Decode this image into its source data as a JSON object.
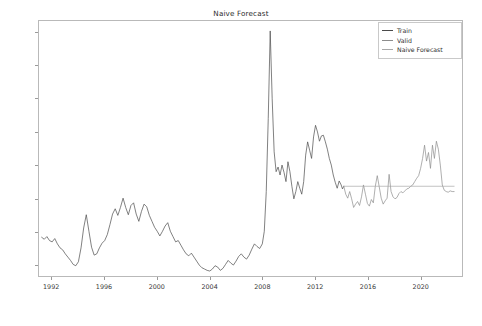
{
  "chart_data": {
    "type": "line",
    "title": "Naive Forecast",
    "xlabel": "",
    "ylabel": "",
    "xlim": [
      1991.0,
      1992.6
    ],
    "ylim": [
      165,
      935
    ],
    "grid": false,
    "legend_position": "upper right",
    "xticks": [
      "1992",
      "1996",
      "2000",
      "2004",
      "2008",
      "2012",
      "2016",
      "2020"
    ],
    "xtick_values": [
      1992,
      1996,
      2000,
      2004,
      2008,
      2012,
      2016,
      2020
    ],
    "yticks": [
      "200",
      "300",
      "400",
      "500",
      "600",
      "700",
      "800",
      "900"
    ],
    "ytick_values": [
      200,
      300,
      400,
      500,
      600,
      700,
      800,
      900
    ],
    "x_axis_range": [
      1991.0,
      2023.2
    ],
    "y_axis_range": [
      165,
      935
    ],
    "series": [
      {
        "name": "Train",
        "color": "#4a4a4a",
        "x": [
          1991.2,
          1991.4,
          1991.6,
          1991.8,
          1992.0,
          1992.2,
          1992.4,
          1992.6,
          1992.8,
          1993.0,
          1993.2,
          1993.4,
          1993.6,
          1993.8,
          1994.0,
          1994.2,
          1994.4,
          1994.6,
          1994.8,
          1995.0,
          1995.2,
          1995.4,
          1995.6,
          1995.8,
          1996.0,
          1996.2,
          1996.4,
          1996.6,
          1996.8,
          1997.0,
          1997.2,
          1997.4,
          1997.6,
          1997.8,
          1998.0,
          1998.2,
          1998.4,
          1998.6,
          1998.8,
          1999.0,
          1999.2,
          1999.4,
          1999.6,
          1999.8,
          2000.0,
          2000.2,
          2000.4,
          2000.6,
          2000.8,
          2001.0,
          2001.2,
          2001.4,
          2001.6,
          2001.8,
          2002.0,
          2002.2,
          2002.4,
          2002.6,
          2002.8,
          2003.0,
          2003.2,
          2003.4,
          2003.6,
          2003.8,
          2004.0,
          2004.2,
          2004.4,
          2004.6,
          2004.8,
          2005.0,
          2005.2,
          2005.4,
          2005.6,
          2005.8,
          2006.0,
          2006.2,
          2006.4,
          2006.6,
          2006.8,
          2007.0,
          2007.2,
          2007.4,
          2007.6,
          2007.8,
          2008.0,
          2008.15,
          2008.3,
          2008.45,
          2008.6,
          2008.75,
          2008.9,
          2009.05,
          2009.2,
          2009.35,
          2009.5,
          2009.65,
          2009.8,
          2009.95,
          2010.1,
          2010.25,
          2010.4,
          2010.55,
          2010.7,
          2010.85,
          2011.0,
          2011.15,
          2011.3,
          2011.45,
          2011.6,
          2011.75,
          2011.9,
          2012.05,
          2012.2,
          2012.35,
          2012.5,
          2012.65,
          2012.8,
          2012.95,
          2013.1,
          2013.25,
          2013.4,
          2013.55,
          2013.7,
          2013.85,
          2014.0,
          2014.1,
          2014.2
        ],
        "y": [
          282,
          276,
          284,
          272,
          268,
          278,
          262,
          250,
          244,
          232,
          222,
          212,
          200,
          196,
          208,
          250,
          310,
          350,
          300,
          252,
          228,
          232,
          250,
          264,
          272,
          290,
          320,
          352,
          368,
          348,
          372,
          400,
          372,
          350,
          378,
          386,
          352,
          330,
          360,
          382,
          374,
          348,
          330,
          312,
          300,
          286,
          300,
          316,
          326,
          300,
          284,
          268,
          272,
          258,
          244,
          232,
          226,
          234,
          222,
          210,
          198,
          190,
          186,
          182,
          180,
          186,
          196,
          192,
          182,
          188,
          200,
          212,
          204,
          198,
          210,
          224,
          232,
          222,
          216,
          228,
          246,
          262,
          254,
          248,
          262,
          300,
          420,
          640,
          905,
          700,
          540,
          480,
          494,
          470,
          500,
          478,
          450,
          510,
          480,
          436,
          398,
          420,
          450,
          430,
          412,
          450,
          530,
          570,
          545,
          520,
          585,
          620,
          600,
          572,
          588,
          590,
          570,
          548,
          520,
          500,
          470,
          448,
          430,
          452,
          440,
          428,
          436
        ]
      },
      {
        "name": "Valid",
        "color": "#8c8c8c",
        "x": [
          2014.2,
          2014.35,
          2014.5,
          2014.65,
          2014.8,
          2014.95,
          2015.1,
          2015.25,
          2015.4,
          2015.55,
          2015.7,
          2015.85,
          2016.0,
          2016.15,
          2016.3,
          2016.45,
          2016.6,
          2016.75,
          2016.9,
          2017.05,
          2017.2,
          2017.35,
          2017.5,
          2017.65,
          2017.8,
          2017.95,
          2018.1,
          2018.25,
          2018.4,
          2018.55,
          2018.7,
          2018.85,
          2019.0,
          2019.15,
          2019.3,
          2019.45,
          2019.6,
          2019.75,
          2019.9,
          2020.05,
          2020.2,
          2020.35,
          2020.5,
          2020.65,
          2020.8,
          2020.95,
          2021.1,
          2021.25,
          2021.4,
          2021.55,
          2021.7,
          2021.85,
          2022.0,
          2022.15,
          2022.3,
          2022.45,
          2022.6
        ],
        "y": [
          436,
          412,
          400,
          420,
          398,
          372,
          382,
          390,
          378,
          404,
          440,
          412,
          384,
          376,
          396,
          386,
          436,
          468,
          434,
          400,
          382,
          392,
          400,
          472,
          420,
          404,
          398,
          402,
          414,
          420,
          416,
          422,
          428,
          430,
          436,
          440,
          450,
          460,
          468,
          490,
          520,
          560,
          512,
          538,
          490,
          560,
          520,
          572,
          548,
          500,
          440,
          424,
          420,
          418,
          422,
          420,
          420
        ]
      },
      {
        "name": "Naive Forecast",
        "color": "#a8a8a8",
        "x": [
          2014.2,
          2022.6
        ],
        "y": [
          436,
          436
        ],
        "note": "flat line held at last training value"
      }
    ]
  },
  "legend": {
    "entries": [
      {
        "label": "Train",
        "color": "#4a4a4a"
      },
      {
        "label": "Valid",
        "color": "#8c8c8c"
      },
      {
        "label": "Naive Forecast",
        "color": "#a8a8a8"
      }
    ]
  }
}
